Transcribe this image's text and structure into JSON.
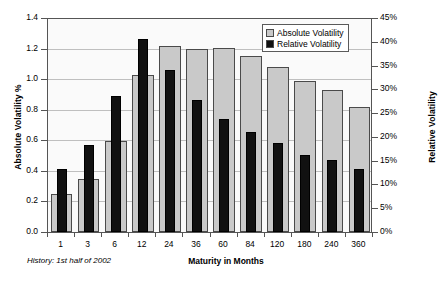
{
  "chart_data": {
    "type": "bar",
    "title": "",
    "subtitle": "",
    "xlabel": "Maturity in Months",
    "ylabel": "Absolute Volatility %",
    "y2label": "Relative Volatility",
    "footnote": "History: 1st half of 2002",
    "categories": [
      "1",
      "3",
      "6",
      "12",
      "24",
      "36",
      "60",
      "84",
      "120",
      "180",
      "240",
      "360"
    ],
    "series": [
      {
        "name": "Absolute Volatility",
        "axis": "left",
        "color": "#c9c9c9",
        "values": [
          0.25,
          0.345,
          0.595,
          1.03,
          1.22,
          1.195,
          1.205,
          1.15,
          1.08,
          0.985,
          0.93,
          0.82
        ]
      },
      {
        "name": "Relative Volatility",
        "axis": "right",
        "color": "#111111",
        "values": [
          13.3,
          18.2,
          28.5,
          40.5,
          34.0,
          27.8,
          23.8,
          21.1,
          18.7,
          16.3,
          15.1,
          13.3
        ]
      }
    ],
    "ylim": [
      0.0,
      1.4
    ],
    "y2lim": [
      0,
      45
    ],
    "yticks": [
      "0.0",
      "0.2",
      "0.4",
      "0.6",
      "0.8",
      "1.0",
      "1.2",
      "1.4"
    ],
    "ytick_values": [
      0.0,
      0.2,
      0.4,
      0.6,
      0.8,
      1.0,
      1.2,
      1.4
    ],
    "y2ticks": [
      "0%",
      "5%",
      "10%",
      "15%",
      "20%",
      "25%",
      "30%",
      "35%",
      "40%",
      "45%"
    ],
    "y2tick_values": [
      0,
      5,
      10,
      15,
      20,
      25,
      30,
      35,
      40,
      45
    ],
    "grid": true,
    "legend_position": "top-right",
    "legend": [
      "Absolute Volatility",
      "Relative Volatility"
    ]
  }
}
